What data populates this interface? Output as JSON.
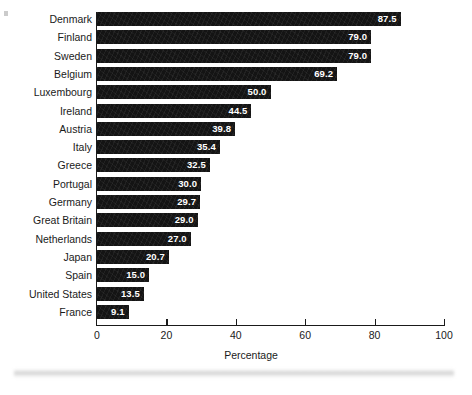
{
  "chart_data": {
    "type": "bar",
    "orientation": "horizontal",
    "title": "",
    "subtitle": "",
    "xlabel": "Percentage",
    "ylabel": "",
    "xlim": [
      0,
      100
    ],
    "xticks": [
      0,
      20,
      40,
      60,
      80,
      100
    ],
    "xtick_labels": [
      "0",
      "20",
      "40",
      "60",
      "80",
      "100"
    ],
    "grid": false,
    "legend": null,
    "value_label_format": "one-decimal",
    "categories": [
      "Denmark",
      "Finland",
      "Sweden",
      "Belgium",
      "Luxembourg",
      "Ireland",
      "Austria",
      "Italy",
      "Greece",
      "Portugal",
      "Germany",
      "Great Britain",
      "Netherlands",
      "Japan",
      "Spain",
      "United States",
      "France"
    ],
    "values": [
      87.5,
      79.0,
      79.0,
      69.2,
      50.0,
      44.5,
      39.8,
      35.4,
      32.5,
      30.0,
      29.7,
      29.0,
      27.0,
      20.7,
      15.0,
      13.5,
      9.1
    ],
    "value_labels": [
      "87.5",
      "79.0",
      "79.0",
      "69.2",
      "50.0",
      "44.5",
      "39.8",
      "35.4",
      "32.5",
      "30.0",
      "29.7",
      "29.0",
      "27.0",
      "20.7",
      "15.0",
      "13.5",
      "9.1"
    ],
    "bars": [
      {
        "category": "Denmark",
        "value": 87.5,
        "label": "87.5"
      },
      {
        "category": "Finland",
        "value": 79.0,
        "label": "79.0"
      },
      {
        "category": "Sweden",
        "value": 79.0,
        "label": "79.0"
      },
      {
        "category": "Belgium",
        "value": 69.2,
        "label": "69.2"
      },
      {
        "category": "Luxembourg",
        "value": 50.0,
        "label": "50.0"
      },
      {
        "category": "Ireland",
        "value": 44.5,
        "label": "44.5"
      },
      {
        "category": "Austria",
        "value": 39.8,
        "label": "39.8"
      },
      {
        "category": "Italy",
        "value": 35.4,
        "label": "35.4"
      },
      {
        "category": "Greece",
        "value": 32.5,
        "label": "32.5"
      },
      {
        "category": "Portugal",
        "value": 30.0,
        "label": "30.0"
      },
      {
        "category": "Germany",
        "value": 29.7,
        "label": "29.7"
      },
      {
        "category": "Great Britain",
        "value": 29.0,
        "label": "29.0"
      },
      {
        "category": "Netherlands",
        "value": 27.0,
        "label": "27.0"
      },
      {
        "category": "Japan",
        "value": 20.7,
        "label": "20.7"
      },
      {
        "category": "Spain",
        "value": 15.0,
        "label": "15.0"
      },
      {
        "category": "United States",
        "value": 13.5,
        "label": "13.5"
      },
      {
        "category": "France",
        "value": 9.1,
        "label": "9.1"
      }
    ],
    "colors": {
      "bar": "#141414",
      "value_text": "#ffffff",
      "axis": "#1a1a1a",
      "label_text": "#1a1a1a",
      "background": "#ffffff"
    }
  }
}
